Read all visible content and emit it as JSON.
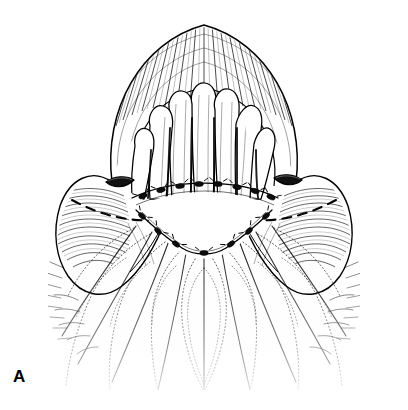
{
  "figure": {
    "panel_label": "A",
    "type": "anatomical-line-illustration",
    "medium": "pen-and-ink stipple and hatching",
    "background_color": "#ffffff",
    "ink_color": "#000000",
    "caption_text": "",
    "regions": [
      {
        "name": "upper-arched-ridge",
        "description": "heavily cross-hatched arched ridge forming the upper border",
        "hatch_density": "dense"
      },
      {
        "name": "central-papillae-cluster",
        "description": "cluster of elongated finger-like papillae projecting downward",
        "projection_count": 7
      },
      {
        "name": "left-lateral-flap",
        "description": "hatched lateral flap with slit opening and dashed incision line"
      },
      {
        "name": "right-lateral-flap",
        "description": "hatched lateral flap with slit opening and dashed incision line"
      },
      {
        "name": "left-slit-opening",
        "description": "small dark slit-shaped aperture on left flap"
      },
      {
        "name": "right-slit-opening",
        "description": "small dark slit-shaped aperture on right flap"
      },
      {
        "name": "central-defect",
        "description": "open unshaded lens-shaped defect bounded by suture lines"
      },
      {
        "name": "lower-scalloped-field",
        "description": "stippled scalloped lobes radiating downward, fading at lower margin"
      }
    ],
    "suture_line_upper": {
      "name": "upper-suture-arc",
      "knot_count": 8,
      "style": "interrupted knots on curved thread"
    },
    "suture_line_lower": {
      "name": "lower-suture-arc",
      "knot_count": 7,
      "style": "interrupted knots on V-shaped thread"
    },
    "incision_lines": {
      "name": "dashed-incision-marks",
      "style": "dashed",
      "sides": [
        "left",
        "right"
      ]
    }
  }
}
